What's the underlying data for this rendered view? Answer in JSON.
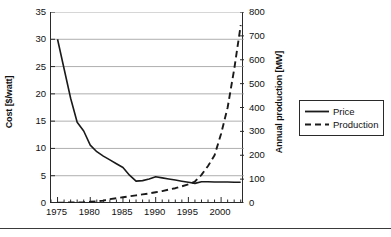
{
  "chart_data": {
    "type": "line",
    "title": "",
    "xlabel": "",
    "grid": "horizontal",
    "legend_position": "right-outside",
    "x_axis": {
      "label": "",
      "ticks": [
        1975,
        1980,
        1985,
        1990,
        1995,
        2000
      ],
      "tick_labels": [
        "1975",
        "1980",
        "1985",
        "1990",
        "1995",
        "2000"
      ],
      "minor_tick_step": 1,
      "xlim": [
        1974,
        2003.5
      ]
    },
    "y_axis_left": {
      "label": "Cost [$/watt]",
      "ticks": [
        0,
        5,
        10,
        15,
        20,
        25,
        30,
        35
      ],
      "tick_labels": [
        "0",
        "5",
        "10",
        "15",
        "20",
        "25",
        "30",
        "35"
      ],
      "ylim": [
        0,
        35
      ]
    },
    "y_axis_right": {
      "label": "Annual production [MW]",
      "ticks": [
        0,
        100,
        200,
        300,
        400,
        500,
        600,
        700,
        800
      ],
      "tick_labels": [
        "0",
        "100",
        "200",
        "300",
        "400",
        "500",
        "600",
        "700",
        "800"
      ],
      "ylim": [
        0,
        800
      ]
    },
    "series": [
      {
        "name": "Price",
        "axis": "left",
        "style": "solid",
        "color": "#1a1a1a",
        "unit": "$/watt",
        "x": [
          1975,
          1976,
          1977,
          1978,
          1979,
          1980,
          1981,
          1982,
          1983,
          1984,
          1985,
          1986,
          1987,
          1988,
          1989,
          1990,
          1991,
          1992,
          1993,
          1994,
          1995,
          1996,
          1997,
          1998,
          1999,
          2000,
          2001,
          2002,
          2003
        ],
        "values": [
          30.0,
          24.6,
          19.2,
          14.8,
          13.2,
          10.6,
          9.4,
          8.6,
          7.9,
          7.2,
          6.5,
          5.1,
          4.0,
          4.1,
          4.4,
          4.8,
          4.6,
          4.4,
          4.2,
          4.0,
          3.8,
          3.6,
          3.9,
          3.9,
          3.85,
          3.85,
          3.85,
          3.8,
          3.8
        ]
      },
      {
        "name": "Production",
        "axis": "right",
        "style": "dashed",
        "color": "#1a1a1a",
        "unit": "MW",
        "x": [
          1975,
          1976,
          1977,
          1978,
          1979,
          1980,
          1981,
          1982,
          1983,
          1984,
          1985,
          1986,
          1987,
          1988,
          1989,
          1990,
          1991,
          1992,
          1993,
          1994,
          1995,
          1996,
          1997,
          1998,
          1999,
          2000,
          2001,
          2002,
          2003
        ],
        "values": [
          1,
          1.5,
          2,
          2.5,
          3,
          5,
          7,
          10,
          16,
          20,
          24,
          28,
          32,
          36,
          40,
          45,
          50,
          56,
          62,
          70,
          78,
          90,
          118,
          155,
          200,
          290,
          400,
          560,
          745
        ]
      }
    ]
  },
  "legend": {
    "items": [
      {
        "label": "Price",
        "style": "solid"
      },
      {
        "label": "Production",
        "style": "dashed"
      }
    ]
  }
}
